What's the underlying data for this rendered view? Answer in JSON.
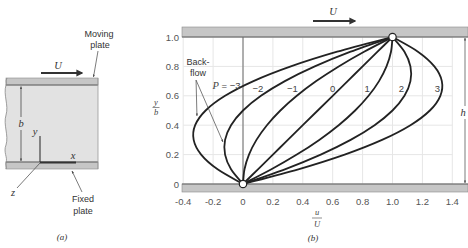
{
  "figure": {
    "panel_a": {
      "label": "(a)",
      "velocity_label": "U",
      "moving_plate_label": {
        "line1": "Moving",
        "line2": "plate"
      },
      "fixed_plate_label": {
        "line1": "Fixed",
        "line2": "plate"
      },
      "gap_label": "b",
      "axis_labels": {
        "x": "x",
        "y": "y",
        "z": "z"
      }
    },
    "panel_b": {
      "label": "(b)",
      "velocity_label": "U",
      "gap_label": "h",
      "backflow_label": {
        "line1": "Back-",
        "line2": "flow"
      },
      "xlabel": {
        "numerator": "u",
        "denominator": "U"
      },
      "ylabel": {
        "numerator": "y",
        "denominator": "b"
      }
    }
  },
  "colors": {
    "plate_fill": "#c6c6c6",
    "plate_edge": "#7a7a7a",
    "fluid_fill": "#e2e2e2",
    "grid": "#e6e6e6",
    "curve": "#222222",
    "axis_line": "#6a6a6a"
  },
  "chart_data": {
    "type": "line",
    "title": "",
    "xlabel": "u/U",
    "ylabel": "y/b",
    "xlim": [
      -0.4,
      1.4
    ],
    "ylim": [
      0,
      1.0
    ],
    "grid": true,
    "legend": "inline labels on curves",
    "xticks": [
      -0.4,
      -0.2,
      0,
      0.2,
      0.4,
      0.6,
      0.8,
      1.0,
      1.2,
      1.4
    ],
    "xtick_labels": [
      "-0.4",
      "-0.2",
      "0",
      "0.2",
      "0.4",
      "0.6",
      "0.8",
      "1.0",
      "1.2",
      "1.4"
    ],
    "yticks": [
      0,
      0.2,
      0.4,
      0.6,
      0.8,
      1.0
    ],
    "ytick_labels": [
      "0",
      "0.2",
      "0.4",
      "0.6",
      "0.8",
      "1.0"
    ],
    "y": [
      0,
      0.1,
      0.2,
      0.3,
      0.4,
      0.5,
      0.6,
      0.7,
      0.8,
      0.9,
      1.0
    ],
    "series": [
      {
        "name": "P = -3",
        "label_prefix": "P",
        "label": "= −3",
        "label_at": [
          -0.11,
          0.673
        ],
        "values": [
          0,
          -0.17,
          -0.28,
          -0.33,
          -0.32,
          -0.25,
          -0.12,
          0.07,
          0.32,
          0.63,
          1
        ]
      },
      {
        "name": "P = -2",
        "label": "−2",
        "label_at": [
          0.1,
          0.653
        ],
        "values": [
          0,
          -0.08,
          -0.12,
          -0.12,
          -0.08,
          0,
          0.12,
          0.28,
          0.48,
          0.72,
          1
        ]
      },
      {
        "name": "P = -1",
        "label": "−1",
        "label_at": [
          0.33,
          0.653
        ],
        "values": [
          0,
          0.01,
          0.04,
          0.09,
          0.16,
          0.25,
          0.36,
          0.49,
          0.64,
          0.81,
          1
        ]
      },
      {
        "name": "P = 0",
        "label": "0",
        "label_at": [
          0.6,
          0.653
        ],
        "values": [
          0,
          0.1,
          0.2,
          0.3,
          0.4,
          0.5,
          0.6,
          0.7,
          0.8,
          0.9,
          1
        ]
      },
      {
        "name": "P = 1",
        "label": "1",
        "label_at": [
          0.83,
          0.653
        ],
        "values": [
          0,
          0.19,
          0.36,
          0.51,
          0.64,
          0.75,
          0.84,
          0.91,
          0.96,
          0.99,
          1
        ]
      },
      {
        "name": "P = 2",
        "label": "2",
        "label_at": [
          1.06,
          0.653
        ],
        "values": [
          0,
          0.28,
          0.52,
          0.72,
          0.88,
          1.0,
          1.08,
          1.12,
          1.12,
          1.08,
          1
        ]
      },
      {
        "name": "P = 3",
        "label": "3",
        "label_at": [
          1.3,
          0.653
        ],
        "values": [
          0,
          0.37,
          0.68,
          0.93,
          1.12,
          1.25,
          1.32,
          1.33,
          1.28,
          1.17,
          1
        ]
      }
    ],
    "endpoints": [
      [
        0,
        0
      ],
      [
        1,
        1
      ]
    ],
    "annotations": [
      {
        "text": "Back-flow",
        "arrows": [
          {
            "from": [
              -0.314,
              0.707
            ],
            "to": [
              -0.308,
              0.463
            ]
          },
          {
            "from": [
              -0.314,
              0.707
            ],
            "to": [
              -0.134,
              0.286
            ]
          }
        ]
      }
    ]
  }
}
